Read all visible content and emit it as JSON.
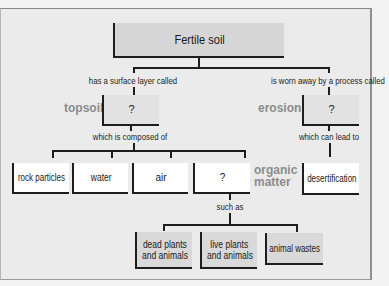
{
  "diagram": {
    "title_node": "Fertile soil",
    "links": {
      "surface_layer": "has a surface layer called",
      "worn_away": "is worn away by a process called",
      "composed_of": "which is composed of",
      "can_lead_to": "which can lead to",
      "such_as": "such as"
    },
    "terms": {
      "topsoil": "topsoil",
      "erosion": "erosion",
      "organic_matter_1": "organic",
      "organic_matter_2": "matter"
    },
    "nodes": {
      "topsoil_blank": "?",
      "erosion_blank": "?",
      "rock_particles": "rock particles",
      "water": "water",
      "air": "air",
      "organic_blank": "?",
      "desertification": "desertification",
      "dead_plants_1": "dead plants",
      "dead_plants_2": "and animals",
      "live_plants_1": "live plants",
      "live_plants_2": "and animals",
      "animal_wastes": "animal wastes"
    },
    "colors": {
      "background": "#ebebeb",
      "term_label": "#8c8c8c",
      "line": "#1e1e1e",
      "top_box": "#d6d6d6",
      "blank_box": "#e2e2e2",
      "white_box": "#ffffff"
    }
  }
}
